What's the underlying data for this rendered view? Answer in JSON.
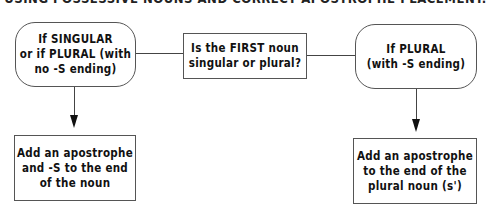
{
  "title": "USING POSSESSIVE NOUNS AND CORRECT APOSTROPHE PLACEMENT.",
  "nodes": {
    "question": "Is the FIRST noun\nsingular or plural?",
    "singular_condition": "If SINGULAR\nor if PLURAL (with\nno -S ending)",
    "plural_condition": "If PLURAL\n(with -S ending)",
    "singular_action": "Add an apostrophe\nand -S to the end\nof the noun",
    "plural_action": "Add an apostrophe\nto the end of the\nplural noun (s')"
  },
  "colors": {
    "line": "#444444",
    "border": "#555555",
    "text": "#111111"
  }
}
